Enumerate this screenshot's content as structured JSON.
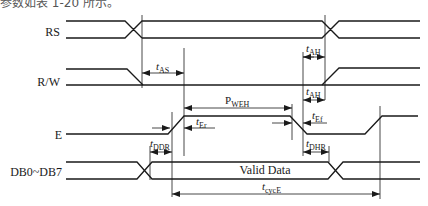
{
  "caption": {
    "text": "参数如表 1-20 所示。"
  },
  "signals": [
    {
      "name": "RS",
      "label": "RS"
    },
    {
      "name": "RW",
      "label": "R/W"
    },
    {
      "name": "E",
      "label": "E"
    },
    {
      "name": "DB",
      "label": "DB0~DB7"
    }
  ],
  "bus": {
    "valid_label": "Valid Data"
  },
  "timings": {
    "tAS": {
      "main": "t",
      "sub": "AS"
    },
    "tAH1": {
      "main": "t",
      "sub": "AH"
    },
    "tAH2": {
      "main": "t",
      "sub": "AH"
    },
    "PWEH": {
      "main": "P",
      "sub": "WEH"
    },
    "tEr": {
      "main": "t",
      "sub": "Er"
    },
    "tEf": {
      "main": "t",
      "sub": "Ef"
    },
    "tDDR": {
      "main": "t",
      "sub": "DDR"
    },
    "tDHR": {
      "main": "t",
      "sub": "DHR"
    },
    "tcycE": {
      "main": "t",
      "sub": "cycE"
    }
  },
  "colors": {
    "line": "#1a1a1a",
    "background": "#ffffff"
  }
}
